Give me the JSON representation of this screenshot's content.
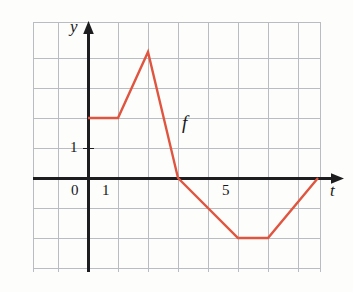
{
  "chart_data": {
    "type": "line",
    "title": "",
    "xlabel": "t",
    "ylabel": "y",
    "series_name": "f",
    "grid": true,
    "legend": "none",
    "xlim": [
      -1.833,
      8.4
    ],
    "ylim": [
      -3.2,
      5.2
    ],
    "xticks": [
      0,
      1,
      5
    ],
    "xticklabels": [
      "0",
      "1",
      "5"
    ],
    "yticks": [
      1
    ],
    "yticklabels": [
      "1"
    ],
    "x": [
      0,
      1,
      2,
      3,
      5,
      6,
      7.667
    ],
    "values": [
      2,
      2,
      4.2,
      0,
      -2,
      -2,
      0
    ],
    "points": [
      {
        "t": 0,
        "y": 2
      },
      {
        "t": 1,
        "y": 2
      },
      {
        "t": 2,
        "y": 4.2
      },
      {
        "t": 3,
        "y": 0
      },
      {
        "t": 5,
        "y": -2
      },
      {
        "t": 6,
        "y": -2
      },
      {
        "t": 7.667,
        "y": 0
      }
    ],
    "curve_color": "#e0553f",
    "grid_color": "#b9bcc0",
    "axis_color": "#1d1d20"
  },
  "labels": {
    "y_axis_var": "y",
    "t_axis_var": "t",
    "function_name": "f",
    "y_tick_1": "1",
    "x_tick_0": "0",
    "x_tick_1": "1",
    "x_tick_5": "5"
  },
  "geometry": {
    "grid_left": 33,
    "grid_top": 22,
    "grid_right": 320,
    "grid_bottom": 272,
    "cell": 30,
    "origin_x": 88,
    "origin_y": 178,
    "unit_x": 30,
    "unit_y": 30
  }
}
